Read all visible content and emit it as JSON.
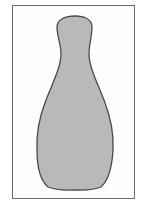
{
  "figure": {
    "colors": {
      "fill": "#b9b9b9",
      "outline": "#4a4a4a",
      "frame": "#6a6a6a",
      "background": "#ffffff"
    }
  }
}
